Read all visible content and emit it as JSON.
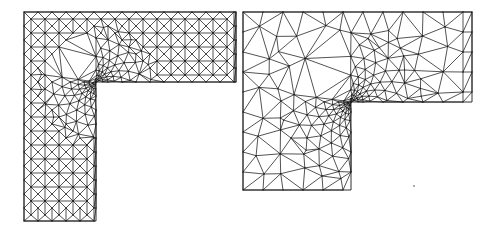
{
  "figure": {
    "width": 497,
    "height": 231,
    "background": "#ffffff",
    "stroke_color": "#1a1a1a"
  },
  "meshes": [
    {
      "name": "structured-refined-mesh",
      "style": "structured",
      "outer": {
        "x0": 24,
        "y0": 12,
        "x1": 236,
        "y1": 221
      },
      "corner": {
        "x": 96,
        "y": 82
      },
      "cell": 14,
      "refine_radius": 55,
      "refine_rings": 9
    },
    {
      "name": "unstructured-refined-mesh",
      "style": "unstructured",
      "outer": {
        "x0": 243,
        "y0": 12,
        "x1": 472,
        "y1": 190
      },
      "corner": {
        "x": 351,
        "y": 102
      },
      "cell": 20,
      "refine_radius": 70,
      "refine_rings": 10
    }
  ],
  "specks": [
    {
      "x": 414,
      "y": 186
    }
  ]
}
